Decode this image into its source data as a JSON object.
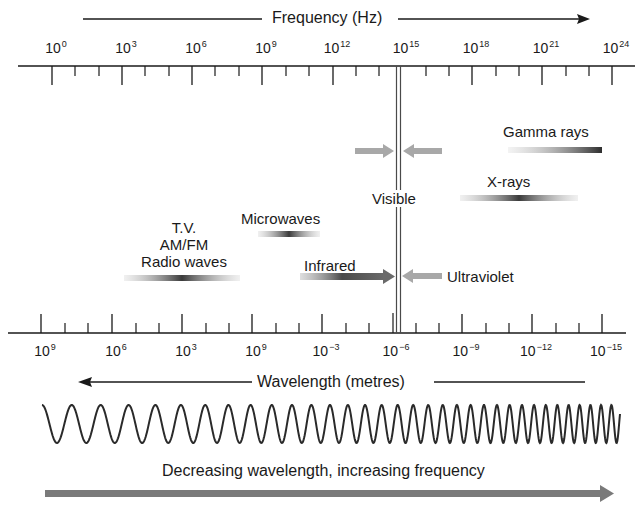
{
  "frequency_axis": {
    "label": "Frequency (Hz)",
    "direction": "increasing to the right",
    "ticks": [
      {
        "base": "10",
        "exp": "0"
      },
      {
        "base": "10",
        "exp": "3"
      },
      {
        "base": "10",
        "exp": "6"
      },
      {
        "base": "10",
        "exp": "9"
      },
      {
        "base": "10",
        "exp": "12"
      },
      {
        "base": "10",
        "exp": "15"
      },
      {
        "base": "10",
        "exp": "18"
      },
      {
        "base": "10",
        "exp": "21"
      },
      {
        "base": "10",
        "exp": "24"
      }
    ]
  },
  "wavelength_axis": {
    "label": "Wavelength (metres)",
    "direction": "increasing to the left",
    "ticks": [
      {
        "base": "10",
        "exp": "9"
      },
      {
        "base": "10",
        "exp": "6"
      },
      {
        "base": "10",
        "exp": "3"
      },
      {
        "base": "10",
        "exp": "9"
      },
      {
        "base": "10",
        "exp": "−3"
      },
      {
        "base": "10",
        "exp": "−6"
      },
      {
        "base": "10",
        "exp": "−9"
      },
      {
        "base": "10",
        "exp": "−12"
      },
      {
        "base": "10",
        "exp": "−15"
      }
    ]
  },
  "bands": {
    "radio_line1": "T.V.",
    "radio_line2": "AM/FM",
    "radio_line3": "Radio waves",
    "microwaves": "Microwaves",
    "infrared": "Infrared",
    "visible": "Visible",
    "ultraviolet": "Ultraviolet",
    "xrays": "X-rays",
    "gamma": "Gamma rays"
  },
  "footer": {
    "caption": "Decreasing wavelength, increasing frequency"
  },
  "colors": {
    "ink": "#1a1a1a",
    "band_dark": "#3a3a3a",
    "arrow_gray": "#7a7a7a",
    "visible_arrow_gray": "#a8a8a8"
  }
}
